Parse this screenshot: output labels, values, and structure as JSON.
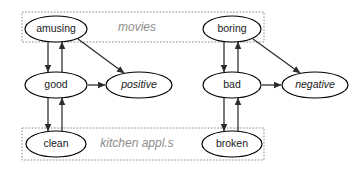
{
  "diagram": {
    "type": "directed-graph",
    "background_color": "#ffffff",
    "node_stroke_color": "#000000",
    "node_fill_color": "#ffffff",
    "edge_color": "#2b2b2b",
    "group_box_color": "#8a8a8a",
    "group_label_color": "#8d8d8d",
    "groups": [
      {
        "id": "movies",
        "label": "movies",
        "x": 22,
        "y": 12,
        "width": 242,
        "height": 30,
        "label_x": 137,
        "label_y": 28
      },
      {
        "id": "kitchen",
        "label": "kitchen appl.s",
        "x": 22,
        "y": 128,
        "width": 242,
        "height": 32,
        "label_x": 137,
        "label_y": 144
      }
    ],
    "nodes": [
      {
        "id": "amusing",
        "label": "amusing",
        "cx": 56,
        "cy": 29,
        "rx": 31,
        "ry": 13,
        "italic": false
      },
      {
        "id": "boring",
        "label": "boring",
        "cx": 232,
        "cy": 29,
        "rx": 29,
        "ry": 13,
        "italic": false
      },
      {
        "id": "good",
        "label": "good",
        "cx": 56,
        "cy": 85,
        "rx": 31,
        "ry": 13,
        "italic": false
      },
      {
        "id": "bad",
        "label": "bad",
        "cx": 232,
        "cy": 85,
        "rx": 29,
        "ry": 13,
        "italic": false
      },
      {
        "id": "positive",
        "label": "positive",
        "cx": 139,
        "cy": 85,
        "rx": 33,
        "ry": 13,
        "italic": true
      },
      {
        "id": "negative",
        "label": "negative",
        "cx": 315,
        "cy": 85,
        "rx": 33,
        "ry": 13,
        "italic": true
      },
      {
        "id": "clean",
        "label": "clean",
        "cx": 56,
        "cy": 144,
        "rx": 30,
        "ry": 13,
        "italic": false
      },
      {
        "id": "broken",
        "label": "broken",
        "cx": 232,
        "cy": 144,
        "rx": 30,
        "ry": 13,
        "italic": false
      }
    ],
    "edges": [
      {
        "id": "amusing-to-good",
        "from": "amusing",
        "to": "good",
        "x1": 48,
        "y1": 42,
        "x2": 48,
        "y2": 72,
        "arrow": "end"
      },
      {
        "id": "good-to-amusing",
        "from": "good",
        "to": "amusing",
        "x1": 62,
        "y1": 72,
        "x2": 62,
        "y2": 42,
        "arrow": "end"
      },
      {
        "id": "good-to-clean",
        "from": "good",
        "to": "clean",
        "x1": 48,
        "y1": 98,
        "x2": 48,
        "y2": 131,
        "arrow": "end"
      },
      {
        "id": "clean-to-good",
        "from": "clean",
        "to": "good",
        "x1": 62,
        "y1": 131,
        "x2": 62,
        "y2": 98,
        "arrow": "end"
      },
      {
        "id": "good-to-positive",
        "from": "good",
        "to": "positive",
        "x1": 88,
        "y1": 85,
        "x2": 105,
        "y2": 85,
        "arrow": "end"
      },
      {
        "id": "amusing-to-positive",
        "from": "amusing",
        "to": "positive",
        "x1": 78,
        "y1": 39,
        "x2": 124,
        "y2": 73,
        "arrow": "end"
      },
      {
        "id": "boring-to-bad",
        "from": "boring",
        "to": "bad",
        "x1": 224,
        "y1": 42,
        "x2": 224,
        "y2": 72,
        "arrow": "end"
      },
      {
        "id": "bad-to-boring",
        "from": "bad",
        "to": "boring",
        "x1": 238,
        "y1": 72,
        "x2": 238,
        "y2": 42,
        "arrow": "end"
      },
      {
        "id": "bad-to-broken",
        "from": "bad",
        "to": "broken",
        "x1": 224,
        "y1": 98,
        "x2": 224,
        "y2": 131,
        "arrow": "end"
      },
      {
        "id": "broken-to-bad",
        "from": "broken",
        "to": "bad",
        "x1": 238,
        "y1": 131,
        "x2": 238,
        "y2": 98,
        "arrow": "end"
      },
      {
        "id": "bad-to-negative",
        "from": "bad",
        "to": "negative",
        "x1": 262,
        "y1": 85,
        "x2": 281,
        "y2": 85,
        "arrow": "end"
      },
      {
        "id": "boring-to-negative",
        "from": "boring",
        "to": "negative",
        "x1": 253,
        "y1": 39,
        "x2": 300,
        "y2": 73,
        "arrow": "end"
      }
    ]
  }
}
